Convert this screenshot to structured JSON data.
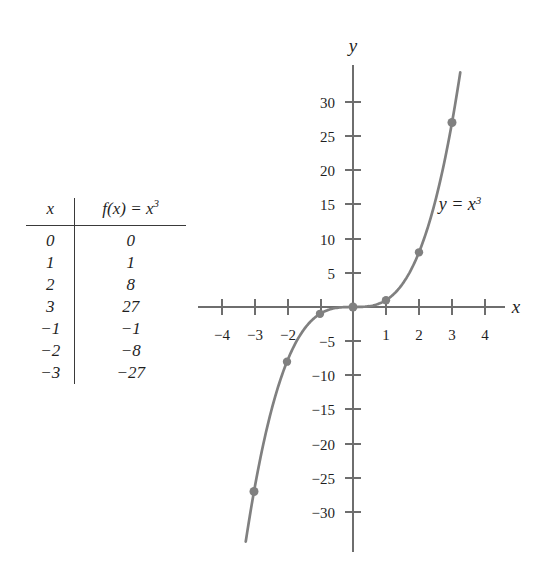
{
  "table": {
    "name": "table-of-values",
    "headers": {
      "x": "x",
      "fx": "f(x) = x",
      "fx_exponent": "3"
    },
    "rows": [
      {
        "x": "0",
        "fx": "0"
      },
      {
        "x": "1",
        "fx": "1"
      },
      {
        "x": "2",
        "fx": "8"
      },
      {
        "x": "3",
        "fx": "27"
      },
      {
        "x": "−1",
        "fx": "−1"
      },
      {
        "x": "−2",
        "fx": "−8"
      },
      {
        "x": "−3",
        "fx": "−27"
      }
    ]
  },
  "graph": {
    "x_axis_label": "x",
    "y_axis_label": "y",
    "curve_label": "y = x",
    "curve_label_exponent": "3",
    "curve_color": "#808080",
    "axis_color": "#6e6e6e",
    "point_color": "#808080"
  },
  "chart_data": {
    "type": "line",
    "title": "",
    "subtitle": "",
    "xlabel": "x",
    "ylabel": "y",
    "annotations": [
      "y = x^3"
    ],
    "legend": [],
    "grid": false,
    "xlim": [
      -4.7,
      4.7
    ],
    "ylim": [
      -34,
      34
    ],
    "xticks": [
      -4,
      -3,
      -2,
      -1,
      1,
      2,
      3,
      4
    ],
    "xtick_labels": [
      "−4",
      "−3",
      "−2",
      "",
      "1",
      "2",
      "3",
      "4"
    ],
    "yticks": [
      -30,
      -25,
      -20,
      -15,
      -10,
      -5,
      5,
      10,
      15,
      20,
      25,
      30
    ],
    "ytick_labels": [
      "−30",
      "−25",
      "−20",
      "−15",
      "−10",
      "−5",
      "5",
      "10",
      "15",
      "20",
      "25",
      "30"
    ],
    "series": [
      {
        "name": "y = x^3",
        "expression": "x^3",
        "color": "#808080",
        "marked_points": [
          {
            "x": -3,
            "y": -27
          },
          {
            "x": -2,
            "y": -8
          },
          {
            "x": -1,
            "y": -1
          },
          {
            "x": 0,
            "y": 0
          },
          {
            "x": 1,
            "y": 1
          },
          {
            "x": 2,
            "y": 8
          },
          {
            "x": 3,
            "y": 27
          }
        ],
        "domain_drawn": [
          -3.25,
          3.25
        ]
      }
    ]
  }
}
